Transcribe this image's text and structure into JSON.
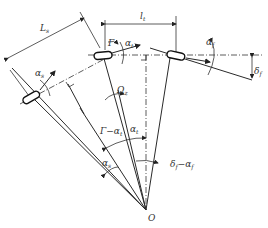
{
  "diagram": {
    "type": "geometric-angle-diagram",
    "labels": {
      "L_s": "L",
      "L_s_sub": "s",
      "L_t": "l",
      "L_t_sub": "t",
      "Gamma": "Γ",
      "alpha_t": "α",
      "alpha_t_sub": "t",
      "alpha_f": "α",
      "alpha_f_sub": "f",
      "delta_f": "δ",
      "delta_f_sub": "f",
      "alpha_s": "α",
      "alpha_s_sub": "s",
      "Omega_z": "Ω",
      "Omega_z_sub": "z",
      "gamma_minus_alpha": "Γ−α",
      "gamma_minus_alpha_sub": "t",
      "alpha_t2": "α",
      "alpha_t2_sub": "t",
      "alpha_s2": "α",
      "alpha_s2_sub": "s",
      "delta_minus_alpha": "δ",
      "delta_minus_alpha_sub1": "f",
      "delta_minus_alpha_mid": "−α",
      "delta_minus_alpha_sub2": "f",
      "origin": "O"
    },
    "colors": {
      "line": "#2a2a2a",
      "background": "#ffffff"
    }
  }
}
